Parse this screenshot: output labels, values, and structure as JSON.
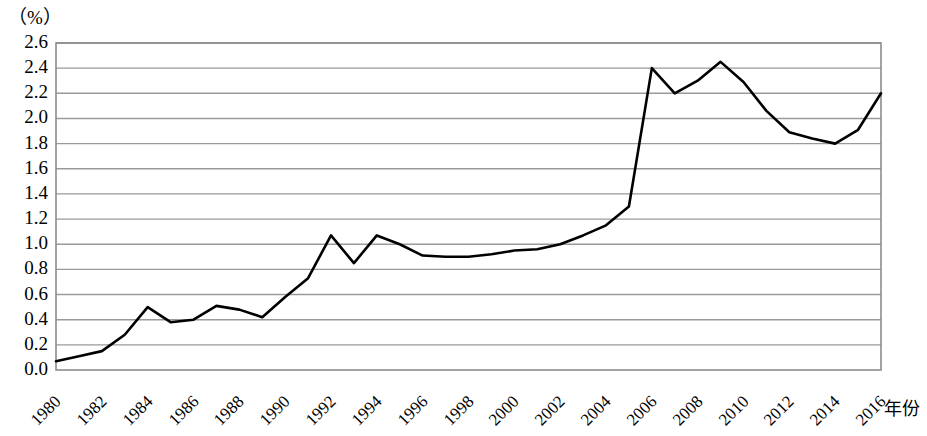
{
  "chart_data": {
    "type": "line",
    "title": "",
    "subtitle": "",
    "unit_label": "（%）",
    "xlabel": "年份",
    "ylabel": "",
    "ylim": [
      0.0,
      2.6
    ],
    "xlim": [
      1980,
      2016
    ],
    "grid": true,
    "legend": null,
    "legend_position": "none",
    "y_ticks": [
      "2.6",
      "2.4",
      "2.2",
      "2.0",
      "1.8",
      "1.6",
      "1.4",
      "1.2",
      "1.0",
      "0.8",
      "0.6",
      "0.4",
      "0.2",
      "0.0"
    ],
    "y_tick_values": [
      2.6,
      2.4,
      2.2,
      2.0,
      1.8,
      1.6,
      1.4,
      1.2,
      1.0,
      0.8,
      0.6,
      0.4,
      0.2,
      0.0
    ],
    "x_ticks": [
      "1980",
      "1982",
      "1984",
      "1986",
      "1988",
      "1990",
      "1992",
      "1994",
      "1996",
      "1998",
      "2000",
      "2002",
      "2004",
      "2006",
      "2008",
      "2010",
      "2012",
      "2014",
      "2016"
    ],
    "x_tick_values": [
      1980,
      1982,
      1984,
      1986,
      1988,
      1990,
      1992,
      1994,
      1996,
      1998,
      2000,
      2002,
      2004,
      2006,
      2008,
      2010,
      2012,
      2014,
      2016
    ],
    "line_color": "#000000",
    "grid_color": "#9a9a9a",
    "border_color": "#8c8c8c",
    "x": [
      1980,
      1981,
      1982,
      1983,
      1984,
      1985,
      1986,
      1987,
      1988,
      1989,
      1990,
      1991,
      1992,
      1993,
      1994,
      1995,
      1996,
      1997,
      1998,
      1999,
      2000,
      2001,
      2002,
      2003,
      2004,
      2005,
      2006,
      2007,
      2008,
      2009,
      2010,
      2011,
      2012,
      2013,
      2014,
      2015,
      2016
    ],
    "values": [
      0.07,
      0.11,
      0.15,
      0.28,
      0.5,
      0.38,
      0.4,
      0.51,
      0.48,
      0.42,
      0.58,
      0.73,
      1.07,
      0.85,
      1.07,
      1.0,
      0.91,
      0.9,
      0.9,
      0.92,
      0.95,
      0.96,
      1.0,
      1.07,
      1.15,
      1.3,
      2.4,
      2.2,
      2.3,
      2.45,
      2.29,
      2.06,
      1.89,
      1.84,
      1.8,
      1.91,
      2.2
    ]
  }
}
